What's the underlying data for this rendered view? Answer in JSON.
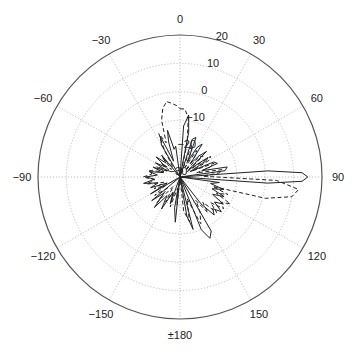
{
  "chart_data": {
    "type": "polar-line",
    "title": "",
    "angle_unit": "degrees",
    "angle_zero": "top",
    "angle_direction": "clockwise",
    "angular_tick_labels": [
      {
        "angle": 0,
        "label": "0"
      },
      {
        "angle": 30,
        "label": "30"
      },
      {
        "angle": 60,
        "label": "60"
      },
      {
        "angle": 90,
        "label": "90"
      },
      {
        "angle": 120,
        "label": "120"
      },
      {
        "angle": 150,
        "label": "150"
      },
      {
        "angle": 180,
        "label": "±180"
      },
      {
        "angle": -150,
        "label": "−150"
      },
      {
        "angle": -120,
        "label": "−120"
      },
      {
        "angle": -90,
        "label": "−90"
      },
      {
        "angle": -60,
        "label": "−60"
      },
      {
        "angle": -30,
        "label": "−30"
      }
    ],
    "radial_range": [
      -30,
      20
    ],
    "radial_ticks": [
      20,
      10,
      0,
      -10,
      -20,
      -30
    ],
    "radial_tick_labels": [
      "20",
      "10",
      "0",
      "−10",
      "−20",
      "−30"
    ],
    "radial_label_angle": 18,
    "grid": true,
    "series": [
      {
        "name": "solid",
        "style": "solid",
        "color": "#222222",
        "points": [
          [
            0,
            -30
          ],
          [
            4,
            -12
          ],
          [
            8,
            -8
          ],
          [
            11,
            -14
          ],
          [
            14,
            -30
          ],
          [
            18,
            -16
          ],
          [
            22,
            -15
          ],
          [
            26,
            -24
          ],
          [
            30,
            -18
          ],
          [
            34,
            -16
          ],
          [
            38,
            -24
          ],
          [
            42,
            -20
          ],
          [
            46,
            -17
          ],
          [
            50,
            -26
          ],
          [
            55,
            -18
          ],
          [
            58,
            -19
          ],
          [
            62,
            -26
          ],
          [
            66,
            -17
          ],
          [
            70,
            -16
          ],
          [
            74,
            -22
          ],
          [
            78,
            -13
          ],
          [
            82,
            -14
          ],
          [
            84,
            -30
          ],
          [
            86,
            1
          ],
          [
            88,
            13
          ],
          [
            90,
            15
          ],
          [
            92,
            13
          ],
          [
            94,
            1
          ],
          [
            96,
            -30
          ],
          [
            98,
            -16
          ],
          [
            102,
            -19
          ],
          [
            106,
            -14
          ],
          [
            110,
            -18
          ],
          [
            114,
            -13
          ],
          [
            118,
            -17
          ],
          [
            122,
            -12
          ],
          [
            126,
            -15
          ],
          [
            130,
            -11
          ],
          [
            134,
            -14
          ],
          [
            138,
            -12
          ],
          [
            142,
            -18
          ],
          [
            146,
            -30
          ],
          [
            150,
            -8
          ],
          [
            154,
            -6
          ],
          [
            158,
            -10
          ],
          [
            162,
            -30
          ],
          [
            166,
            -11
          ],
          [
            170,
            -16
          ],
          [
            174,
            -30
          ],
          [
            180,
            -30
          ],
          [
            186,
            -14
          ],
          [
            190,
            -19
          ],
          [
            196,
            -30
          ],
          [
            200,
            -20
          ],
          [
            205,
            -24
          ],
          [
            210,
            -17
          ],
          [
            215,
            -22
          ],
          [
            220,
            -16
          ],
          [
            225,
            -22
          ],
          [
            230,
            -17
          ],
          [
            235,
            -30
          ],
          [
            240,
            -18
          ],
          [
            245,
            -25
          ],
          [
            250,
            -19
          ],
          [
            255,
            -22
          ],
          [
            260,
            -17
          ],
          [
            265,
            -21
          ],
          [
            270,
            -18
          ],
          [
            275,
            -22
          ],
          [
            280,
            -19
          ],
          [
            285,
            -24
          ],
          [
            290,
            -20
          ],
          [
            295,
            -25
          ],
          [
            300,
            -20
          ],
          [
            305,
            -24
          ],
          [
            310,
            -19
          ],
          [
            315,
            -23
          ],
          [
            320,
            -20
          ],
          [
            325,
            -30
          ],
          [
            330,
            -17
          ],
          [
            334,
            -14
          ],
          [
            338,
            -24
          ],
          [
            342,
            -17
          ],
          [
            345,
            -13
          ],
          [
            348,
            -20
          ],
          [
            352,
            -19
          ],
          [
            356,
            -30
          ],
          [
            360,
            -30
          ]
        ]
      },
      {
        "name": "dashed",
        "style": "dashed",
        "color": "#222222",
        "points": [
          [
            0,
            -6
          ],
          [
            4,
            -6
          ],
          [
            8,
            -9
          ],
          [
            12,
            -18
          ],
          [
            16,
            -30
          ],
          [
            20,
            -18
          ],
          [
            24,
            -20
          ],
          [
            28,
            -26
          ],
          [
            32,
            -19
          ],
          [
            36,
            -21
          ],
          [
            40,
            -27
          ],
          [
            44,
            -20
          ],
          [
            48,
            -19
          ],
          [
            52,
            -27
          ],
          [
            56,
            -17
          ],
          [
            60,
            -18
          ],
          [
            64,
            -25
          ],
          [
            68,
            -17
          ],
          [
            72,
            -19
          ],
          [
            76,
            -24
          ],
          [
            80,
            -15
          ],
          [
            84,
            -16
          ],
          [
            88,
            -22
          ],
          [
            92,
            4
          ],
          [
            96,
            12
          ],
          [
            100,
            10
          ],
          [
            104,
            1
          ],
          [
            106,
            -18
          ],
          [
            110,
            -12
          ],
          [
            114,
            -16
          ],
          [
            118,
            -10
          ],
          [
            122,
            -13
          ],
          [
            126,
            -11
          ],
          [
            130,
            -16
          ],
          [
            134,
            -12
          ],
          [
            138,
            -18
          ],
          [
            142,
            -14
          ],
          [
            146,
            -20
          ],
          [
            150,
            -16
          ],
          [
            156,
            -12
          ],
          [
            162,
            -22
          ],
          [
            168,
            -14
          ],
          [
            174,
            -18
          ],
          [
            180,
            -30
          ],
          [
            186,
            -20
          ],
          [
            192,
            -26
          ],
          [
            198,
            -19
          ],
          [
            204,
            -24
          ],
          [
            210,
            -20
          ],
          [
            216,
            -26
          ],
          [
            222,
            -18
          ],
          [
            228,
            -24
          ],
          [
            234,
            -19
          ],
          [
            240,
            -24
          ],
          [
            246,
            -20
          ],
          [
            252,
            -24
          ],
          [
            258,
            -18
          ],
          [
            264,
            -21
          ],
          [
            270,
            -17
          ],
          [
            276,
            -20
          ],
          [
            282,
            -19
          ],
          [
            288,
            -24
          ],
          [
            294,
            -21
          ],
          [
            300,
            -26
          ],
          [
            306,
            -22
          ],
          [
            312,
            -26
          ],
          [
            318,
            -21
          ],
          [
            324,
            -26
          ],
          [
            330,
            -19
          ],
          [
            334,
            -13
          ],
          [
            338,
            -17
          ],
          [
            342,
            -9
          ],
          [
            346,
            -5
          ],
          [
            350,
            -3
          ],
          [
            354,
            -4
          ],
          [
            358,
            -5
          ],
          [
            360,
            -6
          ]
        ]
      }
    ],
    "legend": null
  }
}
